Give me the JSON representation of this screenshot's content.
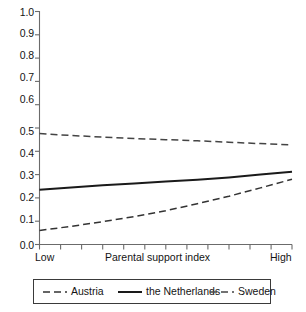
{
  "chart_data": {
    "type": "line",
    "title": "",
    "subtitle": "",
    "xlabel": "Parental support index",
    "ylabel": "",
    "xlim": [
      0,
      1
    ],
    "ylim": [
      0.0,
      1.0
    ],
    "grid": false,
    "legend_position": "bottom",
    "x_tick_labels": [
      "Low",
      "High"
    ],
    "x_tick_count": 13,
    "y_tick_labels": [
      "0.0",
      "0.1",
      "0.2",
      "0.3",
      "0.4",
      "0.5",
      "0.6",
      "0.7",
      "0.8",
      "0.9",
      "1.0"
    ],
    "y_tick_values": [
      0.0,
      0.1,
      0.2,
      0.3,
      0.4,
      0.5,
      0.6,
      0.7,
      0.8,
      0.9,
      1.0
    ],
    "x": [
      0.0,
      0.125,
      0.25,
      0.375,
      0.5,
      0.625,
      0.75,
      0.875,
      1.0
    ],
    "series": [
      {
        "name": "Austria",
        "style": "dashed",
        "color": "#333333",
        "values": [
          0.06,
          0.078,
          0.098,
          0.12,
          0.145,
          0.175,
          0.207,
          0.243,
          0.28
        ]
      },
      {
        "name": "the Netherlands",
        "style": "solid",
        "color": "#1a1a1a",
        "values": [
          0.235,
          0.245,
          0.254,
          0.262,
          0.27,
          0.278,
          0.288,
          0.3,
          0.312
        ]
      },
      {
        "name": "Sweden",
        "style": "dashed",
        "color": "#444444",
        "values": [
          0.476,
          0.468,
          0.461,
          0.455,
          0.45,
          0.445,
          0.439,
          0.433,
          0.428
        ]
      }
    ]
  },
  "axis": {
    "y_labels": [
      "1.0",
      "0.9",
      "0.8",
      "0.7",
      "0.6",
      "0.5",
      "0.4",
      "0.3",
      "0.2",
      "0.1",
      "0.0"
    ],
    "x_left_label": "Low",
    "x_center_label": "Parental support index",
    "x_right_label": "High"
  },
  "legend": {
    "items": [
      {
        "label": "Austria",
        "style": "dashed"
      },
      {
        "label": "the Netherlands",
        "style": "solid"
      },
      {
        "label": "Sweden",
        "style": "dashed"
      }
    ]
  }
}
